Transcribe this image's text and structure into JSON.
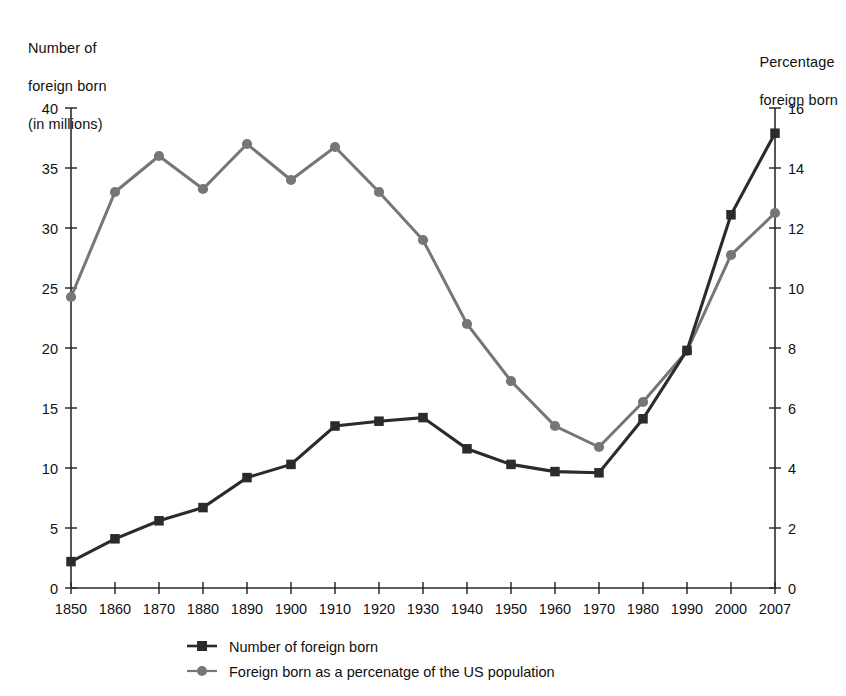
{
  "chart_data": {
    "type": "line",
    "title": "",
    "subtitle": "",
    "xlabel": "",
    "ylabel": "Number of\nforeign born\n(in millions)",
    "y2label": "Percentage\nforeign born",
    "grid": false,
    "legend_position": "bottom",
    "x": [
      "1850",
      "1860",
      "1870",
      "1880",
      "1890",
      "1900",
      "1910",
      "1920",
      "1930",
      "1940",
      "1950",
      "1960",
      "1970",
      "1980",
      "1990",
      "2000",
      "2007"
    ],
    "xtick_labels": [
      "1850",
      "1860",
      "1870",
      "1880",
      "1890",
      "1900",
      "1910",
      "1920",
      "1930",
      "1940",
      "1950",
      "1960",
      "1970",
      "1980",
      "1990",
      "2000",
      "2007"
    ],
    "ylim": [
      0,
      40
    ],
    "ytick_labels": [
      "0",
      "5",
      "10",
      "15",
      "20",
      "25",
      "30",
      "35",
      "40"
    ],
    "ytick_values": [
      0,
      5,
      10,
      15,
      20,
      25,
      30,
      35,
      40
    ],
    "y2lim": [
      0,
      16
    ],
    "y2tick_labels": [
      "0",
      "2",
      "4",
      "6",
      "8",
      "10",
      "12",
      "14",
      "16"
    ],
    "y2tick_values": [
      0,
      2,
      4,
      6,
      8,
      10,
      12,
      14,
      16
    ],
    "series": [
      {
        "name": "Number of foreign born",
        "axis": "left",
        "marker": "square",
        "color": "#2b2b2b",
        "values": [
          2.2,
          4.1,
          5.6,
          6.7,
          9.2,
          10.3,
          13.5,
          13.9,
          14.2,
          11.6,
          10.3,
          9.7,
          9.6,
          14.1,
          19.8,
          31.1,
          37.9
        ]
      },
      {
        "name": "Foreign born as a percenatge of the US population",
        "axis": "right",
        "marker": "circle",
        "color": "#767676",
        "values": [
          9.7,
          13.2,
          14.4,
          13.3,
          14.8,
          13.6,
          14.7,
          13.2,
          11.6,
          8.8,
          6.9,
          5.4,
          4.7,
          6.2,
          7.9,
          11.1,
          12.5
        ]
      }
    ]
  },
  "legend": {
    "items": [
      {
        "label": "Number of foreign born",
        "color": "#2b2b2b",
        "marker": "square"
      },
      {
        "label": "Foreign born as a percenatge of the US population",
        "color": "#767676",
        "marker": "circle"
      }
    ]
  },
  "axis_titles": {
    "left_line1": "Number of",
    "left_line2": "foreign born",
    "left_line3": "(in millions)",
    "right_line1": "Percentage",
    "right_line2": "foreign born"
  },
  "colors": {
    "series_a": "#2b2b2b",
    "series_b": "#767676",
    "axis": "#2b2b2b",
    "text": "#111111",
    "background": "#ffffff"
  }
}
